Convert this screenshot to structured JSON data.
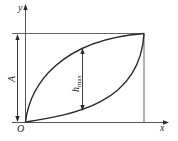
{
  "diagram": {
    "axes": {
      "x_label": "x",
      "y_label": "y",
      "origin_label": "O"
    },
    "dimensions": {
      "amplitude_label": "A",
      "hmax_label_base": "h",
      "hmax_label_sub": "max"
    },
    "curves": [
      {
        "name": "upper-curve",
        "description": "concave rising curve from origin to top-right corner"
      },
      {
        "name": "lower-curve",
        "description": "convex rising curve from origin to top-right corner"
      }
    ],
    "colors": {
      "stroke": "#2a2a2a",
      "thin_stroke": "#555555",
      "background": "#ffffff"
    }
  }
}
